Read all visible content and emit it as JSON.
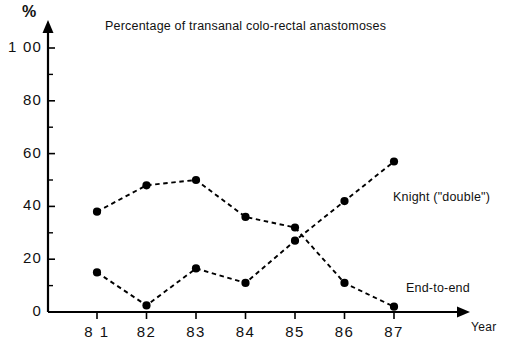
{
  "chart_data": {
    "type": "line",
    "title": "Percentage of transanal colo-rectal anastomoses",
    "xlabel": "Year",
    "ylabel": "%",
    "categories": [
      "81",
      "82",
      "83",
      "84",
      "85",
      "86",
      "87"
    ],
    "x": [
      81,
      82,
      83,
      84,
      85,
      86,
      87
    ],
    "ylim": [
      0,
      100
    ],
    "xlim": [
      80.5,
      87.5
    ],
    "yticks": [
      0,
      20,
      40,
      60,
      80,
      100
    ],
    "ytick_labels": [
      "0",
      "20",
      "40",
      "60",
      "80",
      "1 00"
    ],
    "xtick_labels": [
      "8 1",
      "82",
      "83",
      "84",
      "85",
      "86",
      "87"
    ],
    "grid": false,
    "legend": "inline-annotations",
    "line_style": "dashed",
    "marker": "filled-circle",
    "series": [
      {
        "name": "End-to-end",
        "values": [
          38,
          48,
          50,
          36,
          32,
          11,
          2
        ],
        "label_position": "bottom-right",
        "color": "#000000"
      },
      {
        "name": "Knight (\"double\")",
        "values": [
          15,
          2.5,
          16.5,
          11,
          27,
          42,
          57
        ],
        "label_position": "middle-right",
        "color": "#000000"
      }
    ],
    "annotations": [
      {
        "text": "Knight (\"double\")",
        "series": "Knight (\"double\")"
      },
      {
        "text": "End-to-end",
        "series": "End-to-end"
      }
    ]
  },
  "axes": {
    "y_unit_label": "%",
    "x_title": "Year",
    "y_tick_labels": [
      "1 00",
      "80",
      "60",
      "40",
      "20",
      "0"
    ],
    "x_tick_labels": [
      "8 1",
      "82",
      "83",
      "84",
      "85",
      "86",
      "87"
    ]
  },
  "title": "Percentage of transanal colo-rectal anastomoses",
  "colors": {
    "ink": "#000000",
    "background": "#ffffff"
  }
}
